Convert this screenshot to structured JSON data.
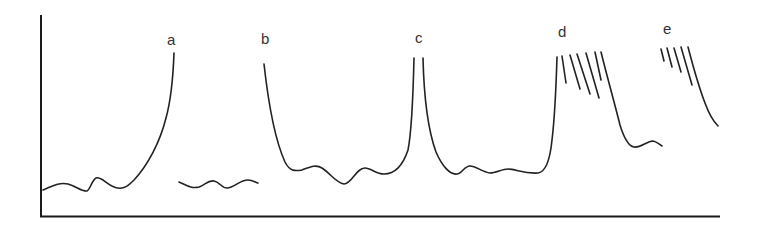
{
  "figure": {
    "axis": {
      "x_label": "",
      "y_label": "",
      "ticks": false
    },
    "curves": [
      {
        "id": "a",
        "label": "a",
        "shape": "low wavy baseline rising steeply to the right (cut off)"
      },
      {
        "id": "a2",
        "label": "",
        "shape": "short wavy baseline segment"
      },
      {
        "id": "b",
        "label": "b",
        "shape": "steep drop from left into wavy baseline"
      },
      {
        "id": "c",
        "label": "c",
        "shape": "sharp narrow peak cut off at top, two branches"
      },
      {
        "id": "d",
        "label": "d",
        "shape": "broad band with hatched (saturated) top, falling to wavy tail"
      },
      {
        "id": "e",
        "label": "e",
        "shape": "hatched top with single falling edge"
      }
    ],
    "labels": {
      "a": "a",
      "b": "b",
      "c": "c",
      "d": "d",
      "e": "e"
    }
  }
}
